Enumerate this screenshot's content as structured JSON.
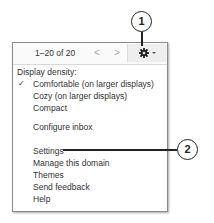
{
  "toolbar": {
    "count": "1–20 of 20",
    "prev_glyph": "<",
    "next_glyph": ">",
    "settings_icon": "gear-icon"
  },
  "menu": {
    "heading": "Display density:",
    "check_glyph": "✓",
    "items": [
      {
        "label": "Comfortable (on larger displays)",
        "checked": true
      },
      {
        "label": "Cozy (on larger displays)"
      },
      {
        "label": "Compact"
      },
      {
        "label": "Configure inbox"
      },
      {
        "label": "Settings"
      },
      {
        "label": "Manage this domain"
      },
      {
        "label": "Themes"
      },
      {
        "label": "Send feedback"
      },
      {
        "label": "Help"
      }
    ]
  },
  "callouts": [
    {
      "number": "1"
    },
    {
      "number": "2"
    }
  ]
}
